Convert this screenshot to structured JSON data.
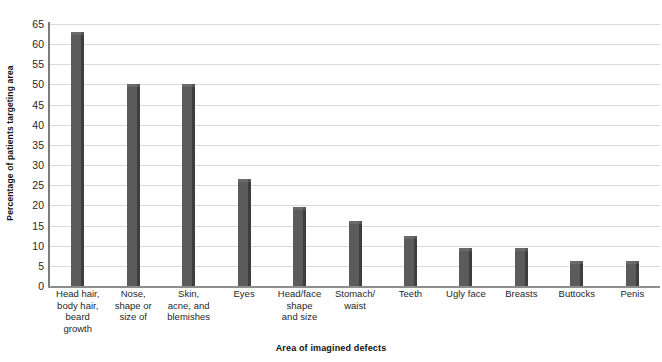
{
  "chart_data": {
    "type": "bar",
    "title": "",
    "xlabel": "Area of imagined defects",
    "ylabel": "Percentage of patients targeting area",
    "ylim": [
      0,
      65
    ],
    "ytick_step": 5,
    "yticks": [
      0,
      5,
      10,
      15,
      20,
      25,
      30,
      35,
      40,
      45,
      50,
      55,
      60,
      65
    ],
    "ytick_labels": [
      "0",
      "5",
      "10",
      "15",
      "20",
      "25",
      "30",
      "35",
      "40",
      "45",
      "50",
      "55",
      "60",
      "65"
    ],
    "grid": true,
    "grid_axis": "y",
    "legend": null,
    "legend_position": "none",
    "bar_color": "#5b5b5b",
    "bar_edge_color": "#3e3e3e",
    "grid_color": "#d8dadd",
    "axis_color": "#8b8e91",
    "background": "#ffffff",
    "categories": [
      "Head hair,\nbody hair,\nbeard\ngrowth",
      "Nose,\nshape or\nsize of",
      "Skin,\nacne, and\nblemishes",
      "Eyes",
      "Head/face\nshape\nand size",
      "Stomach/\nwaist",
      "Teeth",
      "Ugly face",
      "Breasts",
      "Buttocks",
      "Penis"
    ],
    "values": [
      63,
      50,
      50,
      26.5,
      19.7,
      16.2,
      12.3,
      9.5,
      9.5,
      6.2,
      6.3
    ],
    "units": "percent"
  }
}
